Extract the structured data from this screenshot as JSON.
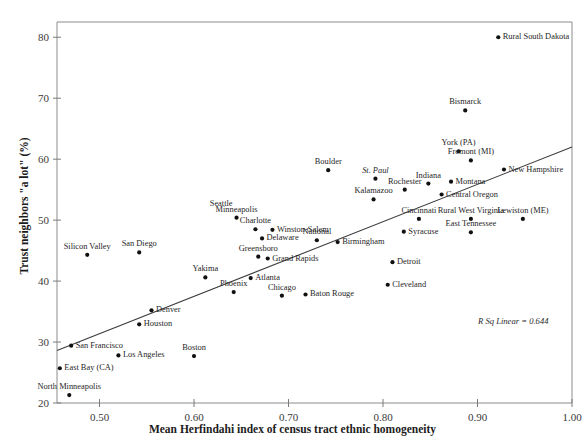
{
  "chart_data": {
    "type": "scatter",
    "title": "",
    "xlabel": "Mean Herfindahi index of census tract ethnic homogeneity",
    "ylabel": "Trust neighbors \"a lot\" (%)",
    "xlim": [
      0.455,
      1.0
    ],
    "ylim": [
      20,
      82.5
    ],
    "xticks": [
      "0.50",
      "0.60",
      "0.70",
      "0.80",
      "0.90",
      "1.00"
    ],
    "xtick_values": [
      0.5,
      0.6,
      0.7,
      0.8,
      0.9,
      1.0
    ],
    "yticks": [
      "20",
      "30",
      "40",
      "50",
      "60",
      "70",
      "80"
    ],
    "ytick_values": [
      20,
      30,
      40,
      50,
      60,
      70,
      80
    ],
    "grid": false,
    "legend": null,
    "annotation": "R Sq Linear = 0.644",
    "r_squared": 0.644,
    "fit_line": {
      "type": "linear",
      "x_start": 0.455,
      "y_start": 28.6,
      "x_end": 1.0,
      "y_end": 62.0
    },
    "points": [
      {
        "label": "Rural South Dakota",
        "x": 0.922,
        "y": 80.0,
        "pos": "right",
        "italic": false
      },
      {
        "label": "Bismarck",
        "x": 0.887,
        "y": 68.0,
        "pos": "center",
        "italic": false
      },
      {
        "label": "York (PA)",
        "x": 0.88,
        "y": 61.3,
        "pos": "center",
        "italic": false
      },
      {
        "label": "Fremont (MI)",
        "x": 0.893,
        "y": 59.8,
        "pos": "center",
        "italic": false
      },
      {
        "label": "New Hampshire",
        "x": 0.928,
        "y": 58.3,
        "pos": "right",
        "italic": false
      },
      {
        "label": "Boulder",
        "x": 0.742,
        "y": 58.2,
        "pos": "center",
        "italic": false
      },
      {
        "label": "St. Paul",
        "x": 0.792,
        "y": 56.8,
        "pos": "center",
        "italic": true
      },
      {
        "label": "Indiana",
        "x": 0.848,
        "y": 56.0,
        "pos": "center",
        "italic": false
      },
      {
        "label": "Montana",
        "x": 0.872,
        "y": 56.3,
        "pos": "right",
        "italic": false
      },
      {
        "label": "Rochester",
        "x": 0.823,
        "y": 55.0,
        "pos": "center",
        "italic": false
      },
      {
        "label": "Central Oregon",
        "x": 0.862,
        "y": 54.2,
        "pos": "right",
        "italic": false
      },
      {
        "label": "Kalamazoo",
        "x": 0.79,
        "y": 53.4,
        "pos": "center",
        "italic": false
      },
      {
        "label": "Minneapolis",
        "x": 0.645,
        "y": 50.4,
        "pos": "center",
        "italic": false
      },
      {
        "label": "Seattle",
        "x": 0.645,
        "y": 52.6,
        "pos": "labelonly-left",
        "italic": false
      },
      {
        "label": "Cincinnati",
        "x": 0.838,
        "y": 50.2,
        "pos": "center",
        "italic": false
      },
      {
        "label": "Rural West Virginia",
        "x": 0.893,
        "y": 50.2,
        "pos": "center",
        "italic": false
      },
      {
        "label": "Lewiston (ME)",
        "x": 0.948,
        "y": 50.2,
        "pos": "center",
        "italic": false
      },
      {
        "label": "Charlotte",
        "x": 0.665,
        "y": 48.5,
        "pos": "center",
        "italic": false
      },
      {
        "label": "Winston-Salem",
        "x": 0.683,
        "y": 48.4,
        "pos": "right",
        "italic": false
      },
      {
        "label": "Syracuse",
        "x": 0.822,
        "y": 48.1,
        "pos": "right",
        "italic": false
      },
      {
        "label": "East Tennessee",
        "x": 0.893,
        "y": 48.0,
        "pos": "center",
        "italic": false
      },
      {
        "label": "Delaware",
        "x": 0.672,
        "y": 47.0,
        "pos": "right",
        "italic": false
      },
      {
        "label": "National",
        "x": 0.73,
        "y": 46.7,
        "pos": "center",
        "italic": false
      },
      {
        "label": "Birmingham",
        "x": 0.752,
        "y": 46.4,
        "pos": "right",
        "italic": false
      },
      {
        "label": "Greensboro",
        "x": 0.668,
        "y": 44.0,
        "pos": "center",
        "italic": false
      },
      {
        "label": "Grand Rapids",
        "x": 0.678,
        "y": 43.7,
        "pos": "right",
        "italic": false
      },
      {
        "label": "Silicon Valley",
        "x": 0.487,
        "y": 44.3,
        "pos": "center",
        "italic": false
      },
      {
        "label": "San Diego",
        "x": 0.542,
        "y": 44.7,
        "pos": "center",
        "italic": false
      },
      {
        "label": "Detroit",
        "x": 0.81,
        "y": 43.1,
        "pos": "right",
        "italic": false
      },
      {
        "label": "Yakima",
        "x": 0.612,
        "y": 40.6,
        "pos": "center",
        "italic": false
      },
      {
        "label": "Atlanta",
        "x": 0.66,
        "y": 40.5,
        "pos": "right",
        "italic": false
      },
      {
        "label": "Cleveland",
        "x": 0.805,
        "y": 39.4,
        "pos": "right",
        "italic": false
      },
      {
        "label": "Phoenix",
        "x": 0.642,
        "y": 38.2,
        "pos": "center",
        "italic": false
      },
      {
        "label": "Chicago",
        "x": 0.693,
        "y": 37.6,
        "pos": "center",
        "italic": false
      },
      {
        "label": "Baton Rouge",
        "x": 0.718,
        "y": 37.8,
        "pos": "right",
        "italic": false
      },
      {
        "label": "Denver",
        "x": 0.555,
        "y": 35.2,
        "pos": "right",
        "italic": false
      },
      {
        "label": "Houston",
        "x": 0.542,
        "y": 32.9,
        "pos": "right",
        "italic": false
      },
      {
        "label": "San Francisco",
        "x": 0.47,
        "y": 29.4,
        "pos": "right",
        "italic": false
      },
      {
        "label": "Los Angeles",
        "x": 0.52,
        "y": 27.8,
        "pos": "right",
        "italic": false
      },
      {
        "label": "Boston",
        "x": 0.6,
        "y": 27.7,
        "pos": "center",
        "italic": false
      },
      {
        "label": "East Bay (CA)",
        "x": 0.458,
        "y": 25.7,
        "pos": "right",
        "italic": false
      },
      {
        "label": "North Minneapolis",
        "x": 0.468,
        "y": 21.3,
        "pos": "center",
        "italic": false
      }
    ]
  },
  "plot": {
    "point_color": "#111111",
    "line_color": "#3d3d3d",
    "frame_color": "#8c8c8c",
    "tick_color": "#7a7a7a"
  }
}
